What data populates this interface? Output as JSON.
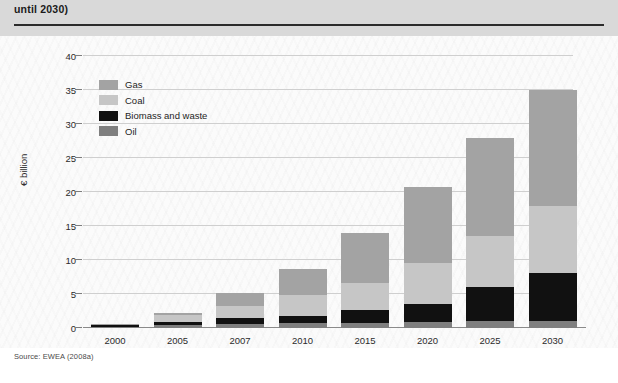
{
  "header": {
    "caption": "until 2030)"
  },
  "footer": {
    "source": "Source: EWEA (2008a)"
  },
  "colors": {
    "gas": "#a3a3a3",
    "coal": "#c6c6c6",
    "biomass": "#111111",
    "oil": "#7f7f7f",
    "gridline": "#cfcfcf",
    "axis": "#8a8a8a",
    "header_band": "#d9d9d9",
    "panel_background": "#fbfbfb"
  },
  "chart_data": {
    "type": "bar",
    "stacked": true,
    "title": "",
    "subtitle": "",
    "xlabel": "",
    "ylabel": "€ billion",
    "ylim": [
      0,
      40
    ],
    "yticks": [
      0,
      5,
      10,
      15,
      20,
      25,
      30,
      35,
      40
    ],
    "ytick_labels": [
      "0",
      "5",
      "10",
      "15",
      "20",
      "25",
      "30",
      "35",
      "40"
    ],
    "grid": true,
    "legend_position": "upper-left-inside",
    "categories": [
      "2000",
      "2005",
      "2007",
      "2010",
      "2015",
      "2020",
      "2025",
      "2030"
    ],
    "series": [
      {
        "name": "Oil",
        "color": "#7f7f7f",
        "values": [
          0.2,
          0.4,
          0.6,
          0.7,
          0.8,
          0.9,
          1.0,
          1.1
        ]
      },
      {
        "name": "Biomass and waste",
        "color": "#111111",
        "values": [
          0.2,
          0.5,
          0.8,
          1.1,
          1.8,
          2.7,
          5.1,
          7.0
        ]
      },
      {
        "name": "Coal",
        "color": "#c6c6c6",
        "values": [
          0.1,
          1.0,
          1.9,
          3.0,
          4.0,
          6.0,
          7.5,
          9.8
        ]
      },
      {
        "name": "Gas",
        "color": "#a3a3a3",
        "values": [
          0.1,
          0.3,
          1.9,
          3.9,
          7.4,
          11.2,
          14.4,
          17.1
        ]
      }
    ],
    "totals": [
      0.6,
      2.2,
      5.2,
      8.7,
      14.0,
      20.8,
      28.0,
      35.0
    ]
  }
}
